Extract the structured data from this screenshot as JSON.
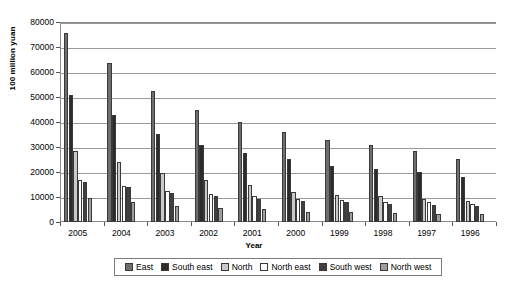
{
  "chart_data": {
    "type": "bar",
    "title": "",
    "xlabel": "Year",
    "ylabel": "100 million yuan",
    "ylim": [
      0,
      80000
    ],
    "ytick_step": 10000,
    "yticks": [
      "80000",
      "70000",
      "60000",
      "50000",
      "40000",
      "30000",
      "20000",
      "10000",
      "0"
    ],
    "grid": true,
    "legend_position": "bottom",
    "categories": [
      "2005",
      "2004",
      "2003",
      "2002",
      "2001",
      "2000",
      "1999",
      "1998",
      "1997",
      "1996"
    ],
    "series": [
      {
        "name": "East",
        "color": "#6e6e6e",
        "values": [
          75500,
          63500,
          52500,
          44700,
          40200,
          36200,
          33000,
          30900,
          28500,
          25300
        ]
      },
      {
        "name": "South east",
        "color": "#2b2b2b",
        "values": [
          51000,
          42800,
          35300,
          30900,
          27800,
          25100,
          22500,
          21400,
          20200,
          18000
        ]
      },
      {
        "name": "North",
        "color": "#c9c9c9",
        "values": [
          28500,
          24200,
          19700,
          16900,
          14700,
          11900,
          10900,
          10400,
          9300,
          8400
        ]
      },
      {
        "name": "North east",
        "color": "#ffffff",
        "values": [
          17000,
          14500,
          12300,
          11400,
          10300,
          9400,
          8800,
          8000,
          7900,
          7400
        ]
      },
      {
        "name": "South west",
        "color": "#404040",
        "values": [
          16000,
          14000,
          11700,
          10400,
          9400,
          8600,
          8000,
          7300,
          7000,
          6500
        ]
      },
      {
        "name": "North west",
        "color": "#9e9e9e",
        "values": [
          9500,
          8000,
          6500,
          5800,
          5100,
          4200,
          4100,
          3700,
          3400,
          3200
        ]
      }
    ]
  }
}
